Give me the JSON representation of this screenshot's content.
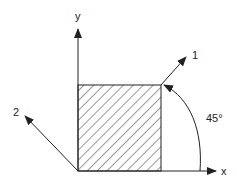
{
  "diagram": {
    "axes": {
      "x_label": "x",
      "y_label": "y"
    },
    "directions": [
      {
        "label": "1",
        "angle_deg": 45
      },
      {
        "label": "2",
        "angle_deg": 135
      }
    ],
    "angle_annotation": "45°",
    "shape": "hatched square element",
    "colors": {
      "line": "#222222",
      "background": "#ffffff"
    }
  }
}
